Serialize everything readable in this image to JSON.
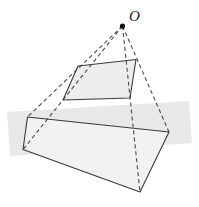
{
  "figure": {
    "labels": [
      {
        "id": "apex-label",
        "text": "O",
        "x": 129,
        "y": 21,
        "style": "italic"
      }
    ],
    "colors": {
      "stroke": "#3a3a3a",
      "dashed_stroke": "#4a4a4a",
      "apex_point": "#111111",
      "upper_face_fill": "#ededed",
      "lower_face_fill": "#f2f2f2",
      "ground_band_fill": "#e8e8e8",
      "background": "#ffffff"
    },
    "points": {
      "O": {
        "x": 122.5,
        "y": 26.0,
        "name": "projection-center"
      },
      "upper": {
        "top_left": {
          "x": 78.0,
          "y": 66.0
        },
        "top_right": {
          "x": 136.0,
          "y": 59.5
        },
        "bottom_right": {
          "x": 130.0,
          "y": 98.0
        },
        "bottom_left": {
          "x": 63.0,
          "y": 100.0
        }
      },
      "lower": {
        "top_left": {
          "x": 27.5,
          "y": 117.0
        },
        "top_right": {
          "x": 169.0,
          "y": 132.0
        },
        "bottom_right": {
          "x": 140.0,
          "y": 192.0
        },
        "bottom_left": {
          "x": 23.0,
          "y": 149.5
        }
      }
    },
    "ground_band": {
      "p1": {
        "x": 7.0,
        "y": 112.0
      },
      "p2": {
        "x": 189.0,
        "y": 101.0
      },
      "p3": {
        "x": 192.0,
        "y": 143.0
      },
      "p4": {
        "x": 10.0,
        "y": 156.0
      }
    },
    "rays": [
      {
        "name": "ray-O-to-lower-top-left",
        "from": "O",
        "to_x": 27.5,
        "to_y": 117.0
      },
      {
        "name": "ray-O-to-lower-bottom-left",
        "from": "O",
        "to_x": 23.0,
        "to_y": 149.5
      },
      {
        "name": "ray-O-to-lower-bottom-right",
        "from": "O",
        "to_x": 140.0,
        "to_y": 192.0
      },
      {
        "name": "ray-O-to-lower-top-right",
        "from": "O",
        "to_x": 169.0,
        "to_y": 132.0
      }
    ],
    "dash_pattern": "4 3",
    "stroke_width": 1.1
  }
}
